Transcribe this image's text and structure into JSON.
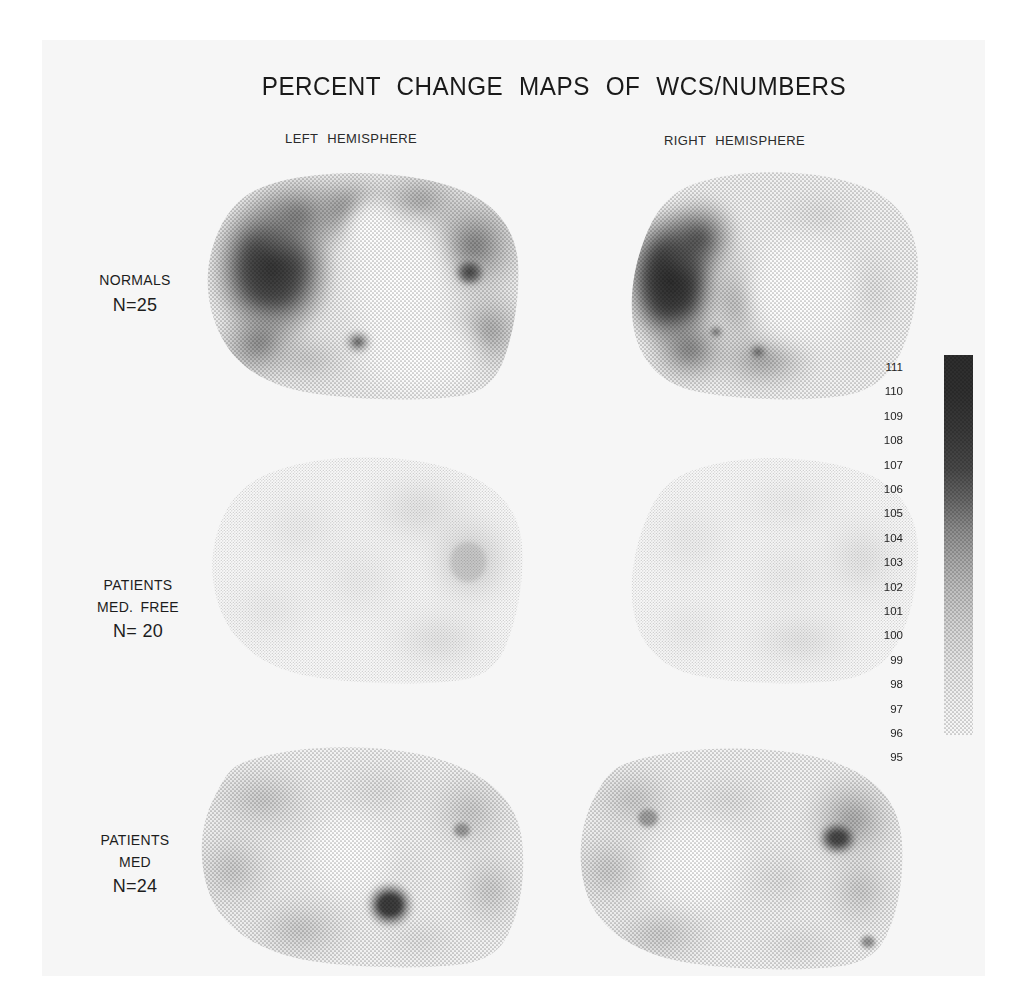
{
  "figure": {
    "title": "PERCENT CHANGE MAPS OF WCS/NUMBERS",
    "columns": [
      {
        "label": "LEFT HEMISPHERE"
      },
      {
        "label": "RIGHT HEMISPHERE"
      }
    ],
    "rows": [
      {
        "group": "NORMALS",
        "condition": "",
        "n": "N=25"
      },
      {
        "group": "PATIENTS",
        "condition": "MED. FREE",
        "n": "N= 20"
      },
      {
        "group": "PATIENTS",
        "condition": "MED",
        "n": "N=24"
      }
    ]
  },
  "colorbar": {
    "units": "percent",
    "orientation": "vertical",
    "high_end": "top",
    "ticks": [
      "111",
      "110",
      "109",
      "108",
      "107",
      "106",
      "105",
      "104",
      "103",
      "102",
      "101",
      "100",
      "99",
      "98",
      "97",
      "96",
      "95"
    ],
    "max": 111,
    "min": 95,
    "dark_color": "#2e2e2e",
    "light_color": "#f4f4f4"
  },
  "chart_data": {
    "type": "heatmap",
    "title": "PERCENT CHANGE MAPS OF WCS/NUMBERS",
    "xlabel": "",
    "ylabel": "",
    "legend_position": "right",
    "grid": false,
    "colorbar_label": "percent change",
    "zlim": [
      95,
      111
    ],
    "columns": [
      "LEFT HEMISPHERE",
      "RIGHT HEMISPHERE"
    ],
    "rows": [
      "NORMALS N=25",
      "PATIENTS MED. FREE N= 20",
      "PATIENTS MED N=24"
    ],
    "panels": [
      {
        "row": "NORMALS N=25",
        "column": "LEFT HEMISPHERE",
        "regions": [
          {
            "name": "frontal-pole",
            "value": 110
          },
          {
            "name": "dorsolateral-frontal",
            "value": 107
          },
          {
            "name": "superior-frontal",
            "value": 105
          },
          {
            "name": "central-midline",
            "value": 98
          },
          {
            "name": "parietal",
            "value": 104
          },
          {
            "name": "occipital",
            "value": 106
          },
          {
            "name": "occipital-focus",
            "value": 110
          },
          {
            "name": "temporal-focus",
            "value": 105
          },
          {
            "name": "inferior-temporal",
            "value": 99
          }
        ]
      },
      {
        "row": "NORMALS N=25",
        "column": "RIGHT HEMISPHERE",
        "regions": [
          {
            "name": "frontal-pole",
            "value": 111
          },
          {
            "name": "dorsolateral-frontal",
            "value": 107
          },
          {
            "name": "superior-frontal",
            "value": 101
          },
          {
            "name": "central-midline",
            "value": 98
          },
          {
            "name": "parietal",
            "value": 99
          },
          {
            "name": "occipital",
            "value": 100
          },
          {
            "name": "inferior-temporal",
            "value": 103
          },
          {
            "name": "temporal-focus",
            "value": 105
          }
        ]
      },
      {
        "row": "PATIENTS MED. FREE N= 20",
        "column": "LEFT HEMISPHERE",
        "regions": [
          {
            "name": "frontal-pole",
            "value": 97
          },
          {
            "name": "dorsolateral-frontal",
            "value": 97
          },
          {
            "name": "superior-frontal",
            "value": 96
          },
          {
            "name": "central-midline",
            "value": 96
          },
          {
            "name": "parietal",
            "value": 98
          },
          {
            "name": "occipital",
            "value": 99
          },
          {
            "name": "occipital-focus",
            "value": 101
          },
          {
            "name": "inferior-temporal",
            "value": 97
          }
        ]
      },
      {
        "row": "PATIENTS MED. FREE N= 20",
        "column": "RIGHT HEMISPHERE",
        "regions": [
          {
            "name": "frontal-pole",
            "value": 97
          },
          {
            "name": "dorsolateral-frontal",
            "value": 97
          },
          {
            "name": "superior-frontal",
            "value": 97
          },
          {
            "name": "central-midline",
            "value": 96
          },
          {
            "name": "parietal",
            "value": 98
          },
          {
            "name": "occipital",
            "value": 98
          },
          {
            "name": "inferior-temporal",
            "value": 97
          }
        ]
      },
      {
        "row": "PATIENTS MED N=24",
        "column": "LEFT HEMISPHERE",
        "regions": [
          {
            "name": "frontal-pole",
            "value": 102
          },
          {
            "name": "dorsolateral-frontal",
            "value": 102
          },
          {
            "name": "superior-frontal",
            "value": 101
          },
          {
            "name": "central-midline",
            "value": 100
          },
          {
            "name": "parietal",
            "value": 101
          },
          {
            "name": "occipital",
            "value": 102
          },
          {
            "name": "inferior-temporal",
            "value": 103
          },
          {
            "name": "temporal-focus",
            "value": 109
          }
        ]
      },
      {
        "row": "PATIENTS MED N=24",
        "column": "RIGHT HEMISPHERE",
        "regions": [
          {
            "name": "frontal-pole",
            "value": 102
          },
          {
            "name": "frontal-focus",
            "value": 105
          },
          {
            "name": "dorsolateral-frontal",
            "value": 101
          },
          {
            "name": "superior-frontal",
            "value": 100
          },
          {
            "name": "central-midline",
            "value": 99
          },
          {
            "name": "parietal",
            "value": 104
          },
          {
            "name": "occipital",
            "value": 105
          },
          {
            "name": "occipital-focus",
            "value": 108
          },
          {
            "name": "inferior-temporal",
            "value": 102
          }
        ]
      }
    ]
  }
}
